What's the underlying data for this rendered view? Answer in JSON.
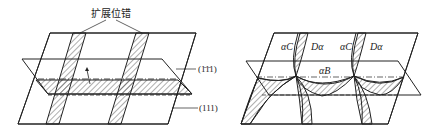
{
  "left_figure": {
    "title_label": "扩展位错",
    "plane_label_upper": "(1̄1̄1)",
    "plane_label_lower": "(111)"
  },
  "right_figure": {
    "labels": [
      {
        "id": "alphaC_1",
        "text": "αC"
      },
      {
        "id": "Dalpha_1",
        "text": "Dα"
      },
      {
        "id": "alphaC_2",
        "text": "αC"
      },
      {
        "id": "Dalpha_2",
        "text": "Dα"
      },
      {
        "id": "alphaB",
        "text": "αB"
      }
    ]
  },
  "colors": {
    "line": "#222222",
    "background": "#ffffff"
  }
}
